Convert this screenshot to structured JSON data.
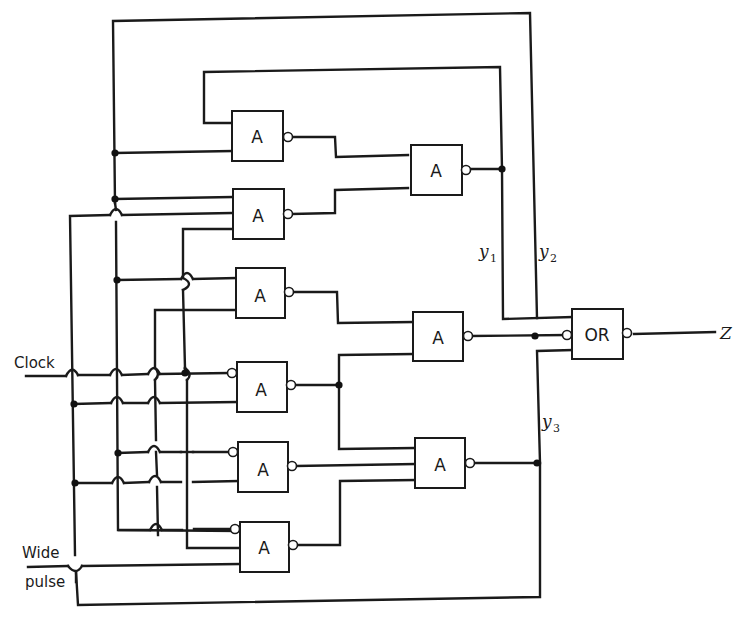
{
  "diagram": {
    "type": "logic-circuit",
    "inputs": {
      "clock": "Clock",
      "wide_pulse_line1": "Wide",
      "wide_pulse_line2": "pulse"
    },
    "output": {
      "label": "Z"
    },
    "state_variables": [
      {
        "name": "y",
        "sub": "1"
      },
      {
        "name": "y",
        "sub": "2"
      },
      {
        "name": "y",
        "sub": "3"
      }
    ],
    "gates": [
      {
        "id": "g1",
        "label": "A",
        "column": "input-stage",
        "row": 1
      },
      {
        "id": "g2",
        "label": "A",
        "column": "input-stage",
        "row": 2
      },
      {
        "id": "g3",
        "label": "A",
        "column": "input-stage",
        "row": 3
      },
      {
        "id": "g4",
        "label": "A",
        "column": "input-stage",
        "row": 4
      },
      {
        "id": "g5",
        "label": "A",
        "column": "input-stage",
        "row": 5
      },
      {
        "id": "g6",
        "label": "A",
        "column": "input-stage",
        "row": 6
      },
      {
        "id": "g7",
        "label": "A",
        "column": "second-stage",
        "row": 1,
        "output": "y1"
      },
      {
        "id": "g8",
        "label": "A",
        "column": "second-stage",
        "row": 2,
        "output": "y2"
      },
      {
        "id": "g9",
        "label": "A",
        "column": "second-stage",
        "row": 3,
        "output": "y3"
      },
      {
        "id": "g10",
        "label": "OR",
        "column": "output-stage",
        "output": "Z"
      }
    ]
  }
}
